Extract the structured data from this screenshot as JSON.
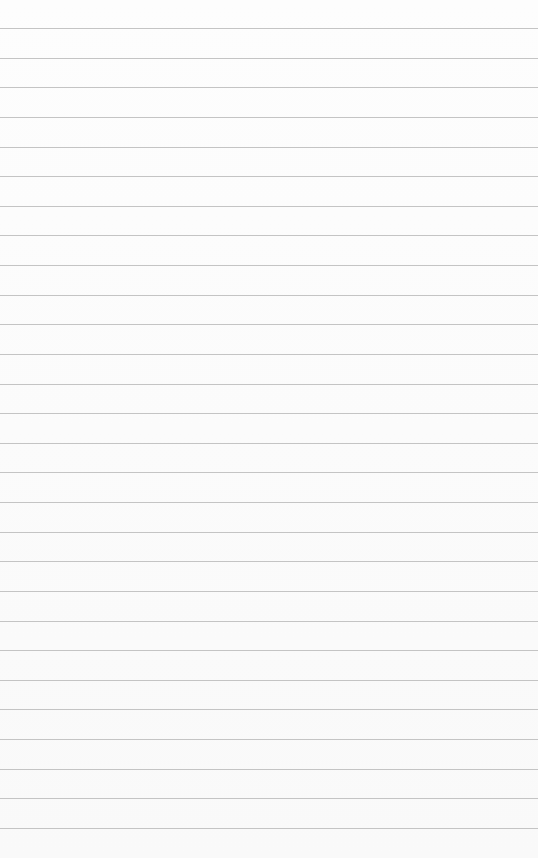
{
  "paper": {
    "type": "lined-paper",
    "background": "#fbfbfb",
    "line_color": "#c4c4c4",
    "line_count": 28,
    "first_line_y": 28,
    "line_spacing": 29.63
  }
}
